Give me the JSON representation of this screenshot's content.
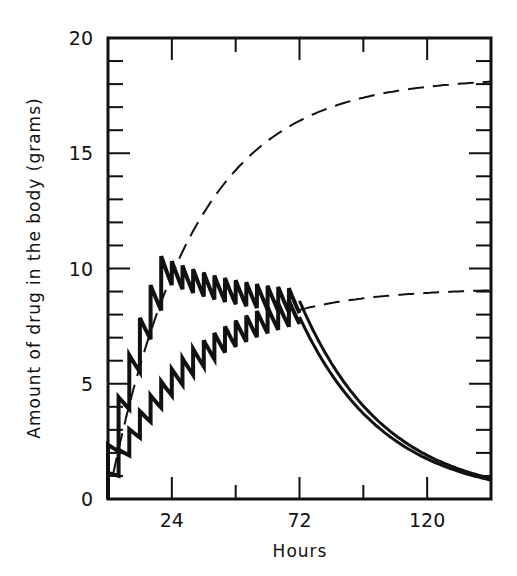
{
  "chart_data": {
    "type": "line",
    "title": "",
    "xlabel": "Hours",
    "ylabel": "Amount of drug in the body (grams)",
    "xlim": [
      0,
      144
    ],
    "ylim": [
      0,
      20
    ],
    "x_ticks": [
      24,
      72,
      120
    ],
    "x_tick_labels": [
      "24",
      "72",
      "120"
    ],
    "x_minor_ticks": [
      24,
      48,
      72,
      96,
      120
    ],
    "y_ticks": [
      0,
      5,
      10,
      15,
      20
    ],
    "y_tick_labels": [
      "0",
      "5",
      "10",
      "15",
      "20"
    ],
    "y_minor_step": 1,
    "grid": false,
    "legend": null,
    "series": [
      {
        "name": "Loading-dose regimen (dashed projection, plateau ~18 g)",
        "style": "dashed",
        "x": [
          0,
          6,
          12,
          18,
          24,
          36,
          48,
          60,
          72,
          96,
          120,
          144
        ],
        "y": [
          0,
          3.6,
          5.8,
          7.6,
          9.2,
          11.8,
          13.7,
          15.0,
          15.9,
          17.0,
          17.5,
          17.9
        ]
      },
      {
        "name": "Maintenance regimen (dashed projection, plateau ~9 g)",
        "style": "dashed",
        "x": [
          72,
          96,
          120,
          144
        ],
        "y": [
          8.0,
          8.6,
          8.9,
          9.1
        ]
      },
      {
        "name": "Loading then maintenance doses (sawtooth)",
        "style": "solid-thick",
        "x": [
          0,
          24,
          72
        ],
        "y": [
          0,
          8.9,
          8.6
        ],
        "plateau_range": [
          8.4,
          8.9
        ]
      },
      {
        "name": "Maintenance doses only (sawtooth)",
        "style": "solid-thick",
        "x": [
          0,
          12,
          24,
          36,
          48,
          60,
          72
        ],
        "y": [
          0,
          2.9,
          4.4,
          5.6,
          6.5,
          7.2,
          7.8
        ]
      },
      {
        "name": "Elimination after dosing stops (double line)",
        "style": "double",
        "x": [
          72,
          84,
          96,
          108,
          120,
          132,
          144
        ],
        "y": [
          8.0,
          5.5,
          3.8,
          2.7,
          1.9,
          1.4,
          1.1
        ]
      }
    ]
  }
}
